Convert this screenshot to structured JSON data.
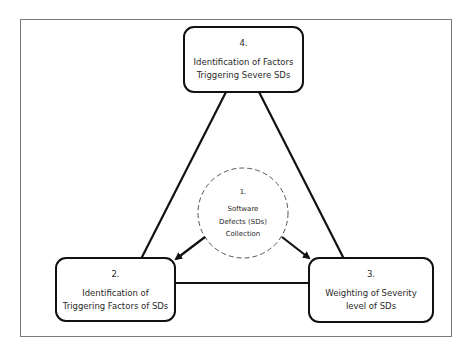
{
  "diagram": {
    "type": "cycle-triangle",
    "center": {
      "number": "1.",
      "label_lines": [
        "Software",
        "Defects (SDs)",
        "Collection"
      ],
      "style": "dashed-circle"
    },
    "nodes": [
      {
        "id": "2",
        "number": "2.",
        "label_lines": [
          "Identification of",
          "Triggering Factors of SDs"
        ],
        "position": "bottom-left"
      },
      {
        "id": "3",
        "number": "3.",
        "label_lines": [
          "Weighting of Severity",
          "level of SDs"
        ],
        "position": "bottom-right"
      },
      {
        "id": "4",
        "number": "4.",
        "label_lines": [
          "Identification of Factors",
          "Triggering Severe SDs"
        ],
        "position": "top"
      }
    ],
    "edges": [
      {
        "from": "1",
        "to": "2",
        "style": "arrow"
      },
      {
        "from": "1",
        "to": "3",
        "style": "arrow"
      },
      {
        "from": "2",
        "to": "3",
        "style": "line"
      },
      {
        "from": "2",
        "to": "4",
        "style": "line"
      },
      {
        "from": "3",
        "to": "4",
        "style": "line"
      }
    ],
    "colors": {
      "stroke": "#111111",
      "frame": "#7a7a7a",
      "background": "#ffffff"
    }
  }
}
